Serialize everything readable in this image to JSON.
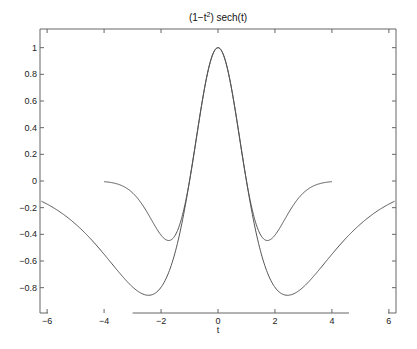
{
  "chart_data": {
    "type": "line",
    "title_parts": {
      "pre": "(1−t",
      "sup": "2",
      "post": ") sech(t)"
    },
    "xlabel": "t",
    "ylabel": "",
    "xlim": [
      -6.25,
      6.25
    ],
    "ylim": [
      -0.99,
      1.14
    ],
    "grid": false,
    "legend": null,
    "xticks": [
      -6,
      -4,
      -2,
      0,
      2,
      4,
      6
    ],
    "xtick_labels": [
      "−6",
      "−4",
      "−2",
      "0",
      "2",
      "4",
      "6"
    ],
    "yticks": [
      1,
      0.8,
      0.6,
      0.4,
      0.2,
      0,
      -0.2,
      -0.4,
      -0.6,
      -0.8
    ],
    "ytick_labels": [
      "1",
      "0.8",
      "0.6",
      "0.4",
      "0.2",
      "0",
      "−0.2",
      "−0.4",
      "−0.6",
      "−0.8"
    ],
    "series": [
      {
        "name": "(1-t^2) sech(t)",
        "x": [
          -6.2,
          -5,
          -4,
          -3,
          -2.4,
          -2,
          -1.5,
          -1,
          -0.5,
          0,
          0.5,
          1,
          1.5,
          2,
          2.4,
          3,
          4,
          5,
          6.2
        ],
        "values": [
          -0.152,
          -0.323,
          -0.549,
          -0.794,
          -0.859,
          -0.805,
          -0.532,
          0,
          0.663,
          1,
          0.663,
          0,
          -0.532,
          -0.805,
          -0.859,
          -0.794,
          -0.549,
          -0.323,
          -0.152
        ]
      },
      {
        "name": "(1-t^2) exp(-t^2/2)",
        "x": [
          -4,
          -3,
          -2.5,
          -2,
          -1.73,
          -1.5,
          -1,
          -0.5,
          0,
          0.5,
          1,
          1.5,
          1.73,
          2,
          2.5,
          3,
          4
        ],
        "values": [
          -0.005,
          -0.089,
          -0.229,
          -0.406,
          -0.446,
          -0.422,
          0,
          0.662,
          1,
          0.662,
          0,
          -0.422,
          -0.446,
          -0.406,
          -0.229,
          -0.089,
          -0.005
        ]
      }
    ],
    "colors": {
      "line": "#555555",
      "axis": "#666666"
    }
  }
}
